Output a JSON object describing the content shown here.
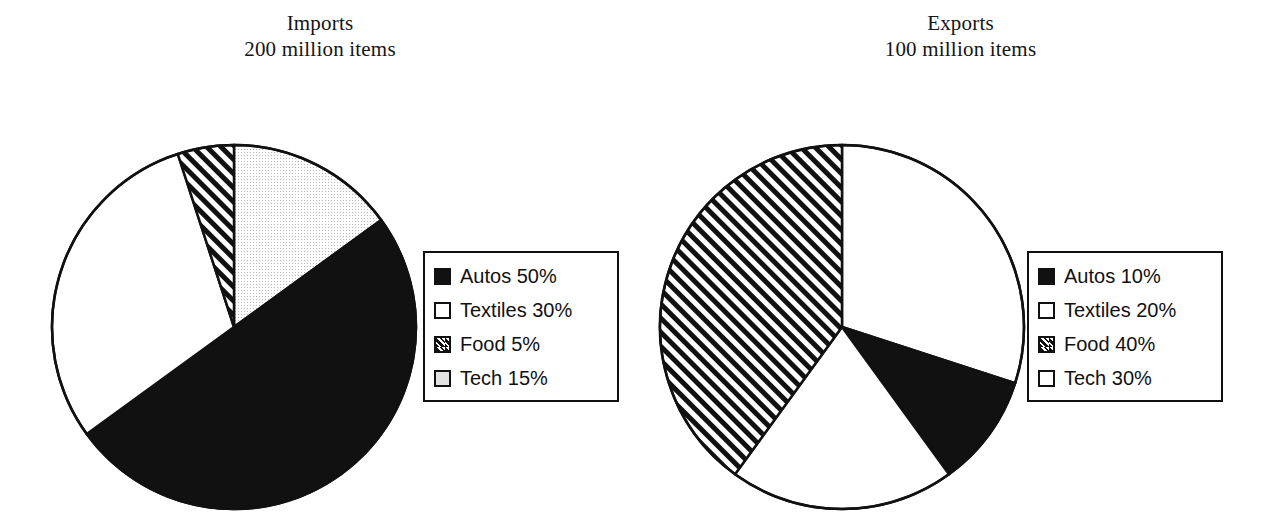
{
  "figure": {
    "background": "#ffffff",
    "ink": "#111111"
  },
  "panels": [
    {
      "id": "imports",
      "title_line1": "Imports",
      "title_line2": "200 million items",
      "legend_title": "",
      "legend": [
        {
          "label": "Autos 50%",
          "swatch": "solid"
        },
        {
          "label": "Textiles 30%",
          "swatch": "empty"
        },
        {
          "label": "Food 5%",
          "swatch": "hatch"
        },
        {
          "label": "Tech 15%",
          "swatch": "gray"
        }
      ]
    },
    {
      "id": "exports",
      "title_line1": "Exports",
      "title_line2": "100 million items",
      "legend_title": "",
      "legend": [
        {
          "label": "Autos 10%",
          "swatch": "solid"
        },
        {
          "label": "Textiles 20%",
          "swatch": "empty"
        },
        {
          "label": "Food 40%",
          "swatch": "hatch"
        },
        {
          "label": "Tech 30%",
          "swatch": "empty"
        }
      ]
    }
  ],
  "chart_data": [
    {
      "type": "pie",
      "title": "Imports\n200 million items",
      "total_label": "200 million items",
      "labels": [
        "Tech",
        "Autos",
        "Textiles",
        "Food"
      ],
      "values": [
        15,
        50,
        30,
        5
      ],
      "unit": "%",
      "start_angle_deg": 0,
      "direction": "clockwise",
      "fills": [
        "gray",
        "solid",
        "empty",
        "hatch"
      ],
      "legend_position": "right",
      "legend_entries": [
        "Autos 50%",
        "Textiles 30%",
        "Food 5%",
        "Tech 15%"
      ],
      "slice_order_clockwise_from_12": [
        {
          "label": "Tech",
          "value": 15,
          "fill": "gray"
        },
        {
          "label": "Autos",
          "value": 50,
          "fill": "solid"
        },
        {
          "label": "Textiles",
          "value": 30,
          "fill": "empty"
        },
        {
          "label": "Food",
          "value": 5,
          "fill": "hatch"
        }
      ]
    },
    {
      "type": "pie",
      "title": "Exports\n100 million items",
      "total_label": "100 million items",
      "labels": [
        "Tech",
        "Autos",
        "Textiles",
        "Food"
      ],
      "values": [
        30,
        10,
        20,
        40
      ],
      "unit": "%",
      "start_angle_deg": 0,
      "direction": "clockwise",
      "fills": [
        "empty",
        "solid",
        "empty",
        "hatch"
      ],
      "legend_position": "right",
      "legend_entries": [
        "Autos 10%",
        "Textiles 20%",
        "Food 40%",
        "Tech 30%"
      ],
      "slice_order_clockwise_from_12": [
        {
          "label": "Tech",
          "value": 30,
          "fill": "empty"
        },
        {
          "label": "Autos",
          "value": 10,
          "fill": "solid"
        },
        {
          "label": "Textiles",
          "value": 20,
          "fill": "empty"
        },
        {
          "label": "Food",
          "value": 40,
          "fill": "hatch"
        }
      ]
    }
  ]
}
